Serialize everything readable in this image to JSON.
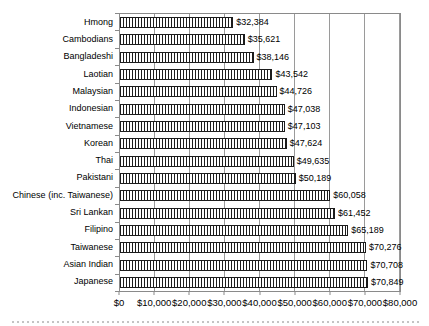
{
  "chart_data": {
    "type": "bar",
    "orientation": "horizontal",
    "title": "",
    "xlabel": "",
    "ylabel": "",
    "xlim": [
      0,
      80000
    ],
    "grid": true,
    "legend": "none",
    "categories": [
      "Hmong",
      "Cambodians",
      "Bangladeshi",
      "Laotian",
      "Malaysian",
      "Indonesian",
      "Vietnamese",
      "Korean",
      "Thai",
      "Pakistani",
      "Chinese (inc. Taiwanese)",
      "Sri Lankan",
      "Filipino",
      "Taiwanese",
      "Asian Indian",
      "Japanese"
    ],
    "values": [
      32384,
      35621,
      38146,
      43542,
      44726,
      47038,
      47103,
      47624,
      49635,
      50189,
      60058,
      61452,
      65189,
      70276,
      70708,
      70849
    ],
    "value_labels": [
      "$32,384",
      "$35,621",
      "$38,146",
      "$43,542",
      "$44,726",
      "$47,038",
      "$47,103",
      "$47,624",
      "$49,635",
      "$50,189",
      "$60,058",
      "$61,452",
      "$65,189",
      "$70,276",
      "$70,708",
      "$70,849"
    ],
    "x_ticks": [
      "$0",
      "$10,000",
      "$20,000",
      "$30,000",
      "$40,000",
      "$50,000",
      "$60,000",
      "$70,000",
      "$80,000"
    ],
    "colors": {
      "background": "#ffffff",
      "grid": "#9a9a9a",
      "frame": "#8a8a8a",
      "bar_fill": "#ffffff",
      "bar_hatch": "#1c1c1c",
      "text": "#000000"
    },
    "bar_pattern": "vertical-hatch"
  }
}
